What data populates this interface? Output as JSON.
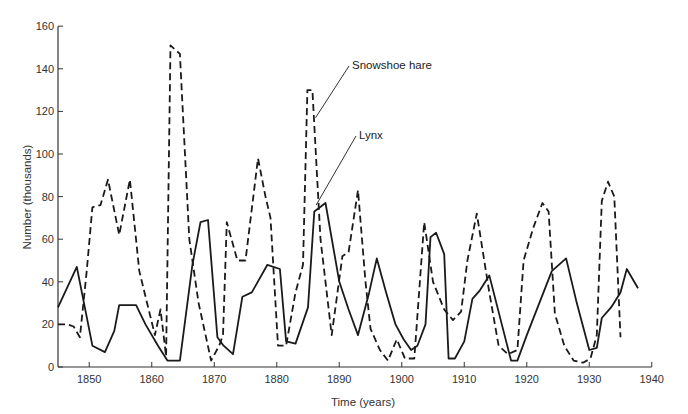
{
  "chart_data": {
    "type": "line",
    "title": "",
    "xlabel": "Time (years)",
    "ylabel": "Number (thousands)",
    "xlim": [
      1845,
      1940
    ],
    "ylim": [
      0,
      160
    ],
    "x_ticks": [
      1850,
      1860,
      1870,
      1880,
      1890,
      1900,
      1910,
      1920,
      1930,
      1940
    ],
    "y_ticks": [
      0,
      20,
      40,
      60,
      80,
      100,
      120,
      140,
      160
    ],
    "grid": false,
    "legend": "inline annotations",
    "annotations": [
      {
        "text": "Snowshoe hare",
        "x": 1886.2,
        "y": 117,
        "label_pos": [
          352,
          69
        ]
      },
      {
        "text": "Lynx",
        "x": 1886.3,
        "y": 76,
        "label_pos": [
          359,
          139
        ]
      }
    ],
    "series": [
      {
        "name": "Snowshoe hare",
        "style": "dashed",
        "x": [
          1845,
          1846.5,
          1847.5,
          1848.5,
          1849.6,
          1850.5,
          1851.8,
          1853,
          1854.8,
          1856.5,
          1858,
          1860.5,
          1861.4,
          1862.3,
          1863,
          1864.5,
          1866,
          1867.5,
          1869.5,
          1870.8,
          1871.4,
          1872,
          1873.7,
          1875,
          1877,
          1878.2,
          1879,
          1880.2,
          1881.5,
          1883,
          1884.2,
          1884.9,
          1885.7,
          1887,
          1888.8,
          1890.5,
          1891.5,
          1893,
          1894.2,
          1895,
          1896.5,
          1897.8,
          1899.2,
          1900.5,
          1902,
          1903.6,
          1905,
          1906.8,
          1908.2,
          1909.5,
          1910.5,
          1912,
          1914,
          1915.5,
          1917,
          1918.5,
          1919.5,
          1921,
          1922.5,
          1923.5,
          1924.5,
          1926,
          1927.5,
          1929,
          1930.2,
          1931.2,
          1932,
          1933,
          1934,
          1935
        ],
        "values": [
          20,
          20,
          19,
          14,
          45,
          75,
          76,
          88,
          62,
          88,
          45,
          15,
          27,
          5,
          151,
          147,
          60,
          30,
          3,
          10,
          15,
          68,
          50,
          50,
          98,
          80,
          70,
          10,
          10,
          35,
          48,
          130,
          130,
          60,
          15,
          52,
          54,
          83,
          40,
          18,
          8,
          3,
          13,
          4,
          4,
          68,
          40,
          27,
          22,
          26,
          50,
          72,
          35,
          10,
          6,
          8,
          50,
          65,
          77,
          73,
          25,
          10,
          3,
          2,
          4,
          15,
          78,
          87,
          80,
          14
        ]
      },
      {
        "name": "Lynx",
        "style": "solid",
        "x": [
          1845,
          1848,
          1850.5,
          1852.5,
          1854,
          1854.8,
          1856,
          1857.5,
          1859,
          1861,
          1862.5,
          1864.5,
          1866.5,
          1867.8,
          1869,
          1870.5,
          1871.5,
          1873,
          1874.5,
          1876,
          1878.5,
          1880.5,
          1881.5,
          1883,
          1885,
          1886,
          1887.8,
          1890,
          1891.5,
          1893,
          1894.8,
          1896,
          1897.5,
          1899,
          1900.3,
          1901.5,
          1902.5,
          1903.8,
          1904.6,
          1905.5,
          1906.8,
          1907.5,
          1908.5,
          1910,
          1911.3,
          1912.5,
          1914,
          1916,
          1917.5,
          1918.5,
          1920,
          1922,
          1924,
          1926.3,
          1928,
          1930,
          1931.2,
          1932,
          1933.5,
          1935,
          1936,
          1937.8
        ],
        "values": [
          28,
          47,
          10,
          7,
          17,
          29,
          29,
          29,
          20,
          10,
          3,
          3,
          48,
          68,
          69,
          14,
          10,
          6,
          33,
          35,
          48,
          46,
          12,
          11,
          28,
          73,
          77,
          40,
          27,
          15,
          35,
          51,
          35,
          20,
          13,
          8,
          10,
          20,
          61,
          63,
          53,
          4,
          4,
          12,
          32,
          36,
          43,
          20,
          3,
          3,
          15,
          30,
          45,
          51,
          30,
          8,
          9,
          23,
          28,
          35,
          46,
          37
        ]
      }
    ]
  },
  "plot_area": {
    "x0_px": 58,
    "x_origin_year": 1845,
    "px_per_year": 6.25,
    "y0_px": 367,
    "px_per_unit": 2.13
  }
}
